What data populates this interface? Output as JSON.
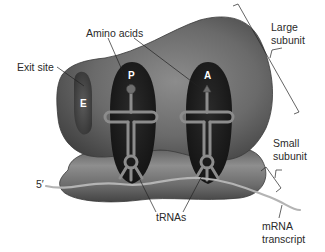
{
  "diagram": {
    "labels": {
      "amino_acids": "Amino acids",
      "exit_site": "Exit site",
      "large_subunit_line1": "Large",
      "large_subunit_line2": "subunit",
      "small_subunit_line1": "Small",
      "small_subunit_line2": "subunit",
      "five_prime": "5′",
      "trnas": "tRNAs",
      "mrna_line1": "mRNA",
      "mrna_line2": "transcript"
    },
    "sites": {
      "e": "E",
      "p": "P",
      "a": "A"
    },
    "colors": {
      "ribosome_dark": "#3a3a3a",
      "ribosome_mid": "#6e6e6e",
      "ribosome_light": "#9a9a9a",
      "pocket": "#1e1e1e",
      "trna": "#8a8a8a",
      "mrna": "#b8b8b8",
      "leader_line": "#222222"
    }
  }
}
